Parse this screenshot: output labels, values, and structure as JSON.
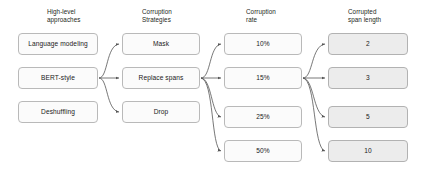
{
  "diagram": {
    "type": "flow-diagram",
    "background_color": "#ffffff",
    "box_fill_plain": "#fbfbfb",
    "box_fill_shaded": "#ececec",
    "box_border_color": "#b9b9b9",
    "edge_color": "#555555",
    "text_color": "#231f20"
  },
  "columns": [
    {
      "key": "high_level_approaches",
      "header": "High-level\napproaches",
      "header_x": 47,
      "header_y": 8,
      "box_x": 18,
      "box_width": 80,
      "box_height": 22,
      "style": "plain",
      "nodes": [
        {
          "label": "Language modeling",
          "y": 33
        },
        {
          "label": "BERT-style",
          "y": 67
        },
        {
          "label": "Deshuffling",
          "y": 101
        }
      ]
    },
    {
      "key": "corruption_strategies",
      "header": "Corruption\nStrategies",
      "header_x": 142,
      "header_y": 8,
      "box_x": 122,
      "box_width": 78,
      "box_height": 22,
      "style": "plain",
      "nodes": [
        {
          "label": "Mask",
          "y": 33
        },
        {
          "label": "Replace spans",
          "y": 67
        },
        {
          "label": "Drop",
          "y": 101
        }
      ]
    },
    {
      "key": "corruption_rate",
      "header": "Corruption\nrate",
      "header_x": 246,
      "header_y": 8,
      "box_x": 224,
      "box_width": 78,
      "box_height": 22,
      "style": "plain",
      "nodes": [
        {
          "label": "10%",
          "y": 33
        },
        {
          "label": "15%",
          "y": 67
        },
        {
          "label": "25%",
          "y": 106
        },
        {
          "label": "50%",
          "y": 140
        }
      ]
    },
    {
      "key": "corrupted_span_length",
      "header": "Corrupted\nspan length",
      "header_x": 348,
      "header_y": 8,
      "box_x": 328,
      "box_width": 80,
      "box_height": 22,
      "style": "shaded",
      "nodes": [
        {
          "label": "2",
          "y": 33
        },
        {
          "label": "3",
          "y": 67
        },
        {
          "label": "5",
          "y": 106
        },
        {
          "label": "10",
          "y": 140
        }
      ]
    }
  ],
  "edges": [
    {
      "from": "BERT-style",
      "to": "Mask"
    },
    {
      "from": "BERT-style",
      "to": "Replace spans"
    },
    {
      "from": "BERT-style",
      "to": "Drop"
    },
    {
      "from": "Replace spans",
      "to": "10%"
    },
    {
      "from": "Replace spans",
      "to": "15%"
    },
    {
      "from": "Replace spans",
      "to": "25%"
    },
    {
      "from": "Replace spans",
      "to": "50%"
    },
    {
      "from": "15%",
      "to": "2"
    },
    {
      "from": "15%",
      "to": "3"
    },
    {
      "from": "15%",
      "to": "5"
    },
    {
      "from": "15%",
      "to": "10"
    }
  ]
}
